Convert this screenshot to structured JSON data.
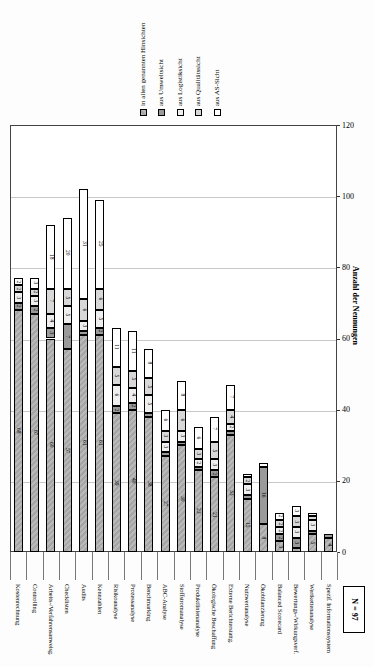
{
  "chart_data": {
    "type": "bar",
    "stacked": true,
    "orientation": "vertical-rotated-page",
    "title": "",
    "axis_label": "Anzahl der Nennungen",
    "note": "N = 97",
    "value_axis": {
      "min": 0,
      "max": 120,
      "tick_step": 20,
      "ticks": [
        0,
        20,
        40,
        60,
        80,
        100,
        120
      ],
      "grid": true
    },
    "legend_position": "top",
    "legend": [
      {
        "label": "in allen genannten Hinsichten",
        "color": "#b9b9b9"
      },
      {
        "label": "aus Umweltsicht",
        "color": "#9a9a9a"
      },
      {
        "label": "aus Logistiksicht",
        "color": "#efefef"
      },
      {
        "label": "aus Qualitätssicht",
        "color": "#d8d8d8"
      },
      {
        "label": "aus AS-Sicht",
        "color": "#ffffff"
      }
    ],
    "categories": [
      "Kostenrechnung",
      "Controlling",
      "Arbeits-/Verfahrensanweisg.",
      "Checklisten",
      "Audits",
      "Kennzahlen",
      "Risikoanalyse",
      "Prozessanalyse",
      "Benchmarking",
      "ABC-Analyse",
      "Stoffstromanalyse",
      "Produktlinienanalyse",
      "Ökologische Beschaffung",
      "Externe Berichterstattg.",
      "Nutzwertanalyse",
      "Ökobilanzierung",
      "Balanced Scorecard",
      "Bewertungs-/Wirkungsverf.",
      "Wertkettenanalyse",
      "Spezif. Informationssystem"
    ],
    "series": [
      {
        "name": "in allen genannten Hinsichten",
        "values": [
          68,
          67,
          60,
          57,
          61,
          61,
          39,
          40,
          38,
          27,
          30,
          23,
          21,
          33,
          15,
          8,
          3,
          1,
          5,
          4
        ]
      },
      {
        "name": "aus Umweltsicht",
        "values": [
          2,
          2,
          3,
          7,
          1,
          2,
          2,
          2,
          1,
          1,
          1,
          1,
          2,
          1,
          1,
          16,
          2,
          3,
          1,
          1
        ]
      },
      {
        "name": "aus Logistiksicht",
        "values": [
          3,
          3,
          4,
          5,
          3,
          5,
          6,
          4,
          5,
          3,
          3,
          2,
          3,
          2,
          3,
          0,
          2,
          3,
          3,
          0
        ]
      },
      {
        "name": "aus Qualitätssicht",
        "values": [
          2,
          2,
          7,
          5,
          6,
          6,
          5,
          5,
          5,
          3,
          6,
          3,
          5,
          4,
          2,
          0,
          2,
          3,
          1,
          0
        ]
      },
      {
        "name": "aus AS-Sicht",
        "values": [
          2,
          3,
          18,
          20,
          31,
          25,
          11,
          11,
          8,
          6,
          8,
          6,
          7,
          7,
          1,
          1,
          2,
          3,
          1,
          0
        ]
      }
    ]
  }
}
